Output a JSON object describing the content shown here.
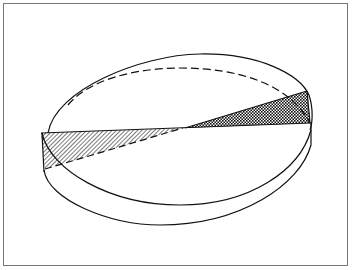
{
  "diagram": {
    "type": "geometric-line-drawing",
    "stroke_color": "#111111",
    "background_color": "#ffffff",
    "border_color": "#777777",
    "elements": [
      {
        "name": "outer-ellipse-top-rim",
        "style": "solid"
      },
      {
        "name": "inner-back-rim",
        "style": "dashed"
      },
      {
        "name": "lower-rim",
        "style": "solid"
      },
      {
        "name": "left-triangle",
        "style": "diagonal-hatch",
        "fill": "#9a9a9a"
      },
      {
        "name": "right-triangle",
        "style": "crosshatch",
        "fill": "#333333"
      }
    ]
  }
}
